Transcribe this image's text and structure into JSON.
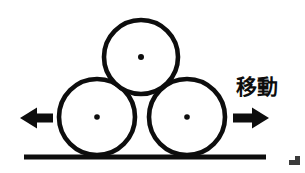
{
  "figure": {
    "kind": "mechanics-diagram",
    "background_color": "#ffffff",
    "ink_color": "#0d0d0d",
    "stroke_width": 4.5
  },
  "labels": {
    "move": "移動"
  },
  "circles": [
    {
      "name": "top-circle",
      "cx": 141,
      "cy": 57,
      "r": 37,
      "center_dot_r": 3.0
    },
    {
      "name": "left-circle",
      "cx": 97,
      "cy": 117,
      "r": 38,
      "center_dot_r": 2.8
    },
    {
      "name": "right-circle",
      "cx": 187,
      "cy": 117,
      "r": 38,
      "center_dot_r": 2.8
    }
  ],
  "ground_line": {
    "name": "ground-line",
    "x1": 24,
    "y1": 157,
    "x2": 266,
    "y2": 157,
    "thickness": 5
  },
  "arrows": [
    {
      "name": "left-arrow",
      "direction": "left",
      "tip_x": 20,
      "tail_x": 52,
      "y": 118,
      "shaft_thickness": 9,
      "head_length": 15,
      "head_half_height": 11
    },
    {
      "name": "right-arrow",
      "direction": "right",
      "tip_x": 269,
      "tail_x": 233,
      "y": 118,
      "shaft_thickness": 9,
      "head_length": 16,
      "head_half_height": 11
    }
  ],
  "artifacts": [
    {
      "name": "corner-scan-mark",
      "x": 289,
      "y": 158,
      "width": 11,
      "height": 8
    }
  ]
}
